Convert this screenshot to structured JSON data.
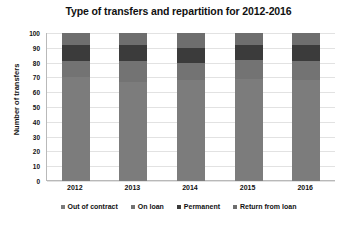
{
  "chart_data": {
    "type": "bar",
    "stacked": true,
    "title": "Type of transfers and repartition for 2012-2016",
    "xlabel": "",
    "ylabel": "Number of transfers",
    "categories": [
      "2012",
      "2013",
      "2014",
      "2015",
      "2016"
    ],
    "ylim": [
      0,
      100
    ],
    "yticks": [
      0,
      10,
      20,
      30,
      40,
      50,
      60,
      70,
      80,
      90,
      100
    ],
    "ytick_labels": [
      "0",
      "10",
      "20",
      "30",
      "40",
      "50",
      "60",
      "70",
      "80",
      "90",
      "100"
    ],
    "grid": true,
    "legend_position": "bottom",
    "series": [
      {
        "name": "Out of contract",
        "color": "#7c7c7c",
        "values": [
          70,
          67,
          68,
          69,
          68
        ]
      },
      {
        "name": "On loan",
        "color": "#737373",
        "values": [
          11,
          14,
          12,
          13,
          13
        ]
      },
      {
        "name": "Permanent",
        "color": "#3b3b3b",
        "values": [
          11,
          11,
          10,
          10,
          11
        ]
      },
      {
        "name": "Return from loan",
        "color": "#6e6e6e",
        "values": [
          8,
          8,
          10,
          8,
          8
        ]
      }
    ]
  },
  "colors": {
    "background": "#ffffff",
    "text": "#111111",
    "gridline": "#e2e2e2",
    "axis": "#b9b9b9"
  }
}
